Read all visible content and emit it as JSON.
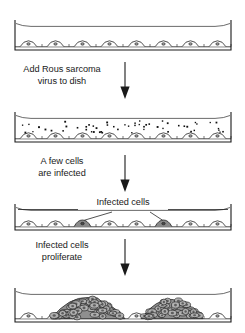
{
  "figure": {
    "colors": {
      "outline": "#1a1a1a",
      "dish_rim": "#5a5a5a",
      "cell_fill": "#ffffff",
      "infected_fill": "#8a8a8a",
      "focus_fill": "#8f8f8f",
      "virus_dot": "#111111",
      "text": "#1a1a1a"
    }
  },
  "panels": [
    {
      "id": "panel-1-normal-monolayer",
      "name": "normal-cell-monolayer-dish",
      "dish": {
        "x": 15,
        "y": 20,
        "width": 216,
        "height": 30,
        "cell_count": 8,
        "infected_indices": [],
        "virus_particles": 0,
        "foci": []
      }
    },
    {
      "id": "panel-2-virus-added",
      "name": "virus-added-dish",
      "dish": {
        "x": 15,
        "y": 112,
        "width": 216,
        "height": 30,
        "cell_count": 8,
        "infected_indices": [],
        "virus_particles": 54,
        "foci": []
      }
    },
    {
      "id": "panel-3-few-infected",
      "name": "few-infected-cells-dish",
      "dish": {
        "x": 15,
        "y": 204,
        "width": 216,
        "height": 26,
        "cell_count": 8,
        "infected_indices": [
          2,
          5
        ],
        "virus_particles": 0,
        "foci": []
      },
      "annotation": {
        "label": "Infected cells",
        "leader_targets": [
          2,
          5
        ]
      }
    },
    {
      "id": "panel-4-proliferated",
      "name": "proliferating-foci-dish",
      "dish": {
        "x": 15,
        "y": 288,
        "width": 216,
        "height": 34,
        "cell_count": 8,
        "infected_indices": [],
        "virus_particles": 0,
        "foci": [
          {
            "center_x": 88,
            "width": 74,
            "height": 22
          },
          {
            "center_x": 172,
            "width": 62,
            "height": 20
          }
        ]
      }
    }
  ],
  "steps": [
    {
      "id": "step-1",
      "name": "add-virus-step",
      "caption": "Add Rous sarcoma\nvirus to dish",
      "caption_x": 12,
      "caption_y": 64,
      "caption_width": 96,
      "arrow": {
        "x": 124,
        "y_start": 62,
        "y_end": 98
      }
    },
    {
      "id": "step-2",
      "name": "few-cells-infected-step",
      "caption": "A few cells\nare infected",
      "caption_x": 12,
      "caption_y": 156,
      "caption_width": 96,
      "arrow": {
        "x": 124,
        "y_start": 155,
        "y_end": 191
      }
    },
    {
      "id": "step-3",
      "name": "cells-proliferate-step",
      "caption": "Infected cells\nproliferate",
      "caption_x": 12,
      "caption_y": 240,
      "caption_width": 96,
      "arrow": {
        "x": 124,
        "y_start": 239,
        "y_end": 275
      }
    }
  ]
}
